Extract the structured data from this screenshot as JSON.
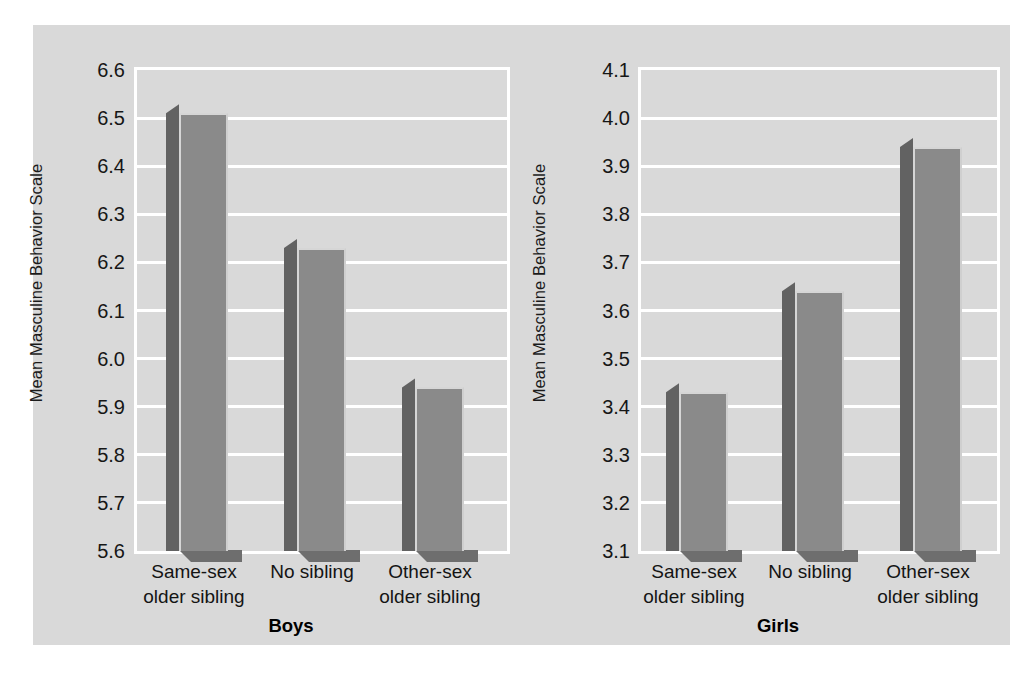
{
  "figure": {
    "background_color": "#d9d9d9",
    "page_background": "#ffffff",
    "bar_front_color": "#8a8a8a",
    "bar_side_color": "#626262",
    "gridline_color": "#ffffff"
  },
  "chart_data": [
    {
      "type": "bar",
      "title": "Boys",
      "xlabel": "",
      "ylabel": "Mean Masculine Behavior Scale",
      "categories": [
        "Same-sex older sibling",
        "No sibling",
        "Other-sex older sibling"
      ],
      "category_lines": [
        [
          "Same-sex",
          "older sibling"
        ],
        [
          "No sibling"
        ],
        [
          "Other-sex",
          "older sibling"
        ]
      ],
      "values": [
        6.51,
        6.23,
        5.94
      ],
      "ylim": [
        5.6,
        6.6
      ],
      "yticks": [
        "6.6",
        "6.5",
        "6.4",
        "6.3",
        "6.2",
        "6.1",
        "6.0",
        "5.9",
        "5.8",
        "5.7",
        "5.6"
      ],
      "ytick_values": [
        6.6,
        6.5,
        6.4,
        6.3,
        6.2,
        6.1,
        6.0,
        5.9,
        5.8,
        5.7,
        5.6
      ],
      "grid": true,
      "legend": "none"
    },
    {
      "type": "bar",
      "title": "Girls",
      "xlabel": "",
      "ylabel": "Mean Masculine Behavior Scale",
      "categories": [
        "Same-sex older sibling",
        "No sibling",
        "Other-sex older sibling"
      ],
      "category_lines": [
        [
          "Same-sex",
          "older sibling"
        ],
        [
          "No sibling"
        ],
        [
          "Other-sex",
          "older sibling"
        ]
      ],
      "values": [
        3.43,
        3.64,
        3.94
      ],
      "ylim": [
        3.1,
        4.1
      ],
      "yticks": [
        "4.1",
        "4.0",
        "3.9",
        "3.8",
        "3.7",
        "3.6",
        "3.5",
        "3.4",
        "3.3",
        "3.2",
        "3.1"
      ],
      "ytick_values": [
        4.1,
        4.0,
        3.9,
        3.8,
        3.7,
        3.6,
        3.5,
        3.4,
        3.3,
        3.2,
        3.1
      ],
      "grid": true,
      "legend": "none"
    }
  ]
}
